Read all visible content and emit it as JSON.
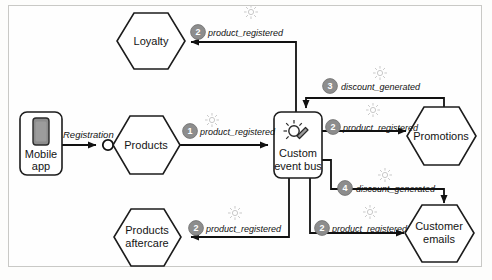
{
  "diagram": {
    "type": "event-driven architecture diagram",
    "frame": {
      "border_color": "#c9c9c6",
      "background": "#fefefe"
    },
    "colors": {
      "stroke": "#1c1c1c",
      "node_fill": "#ffffff",
      "badge_fill": "#8d8d8d",
      "badge_text": "#ffffff",
      "sparkle": "#c9c9c9",
      "connector": "#111111"
    }
  },
  "nodes": [
    {
      "id": "mobile-app",
      "label_line1": "Mobile",
      "label_line2": "app",
      "shape": "rounded-rect",
      "icon": "mobile-phone-icon"
    },
    {
      "id": "products",
      "label_line1": "Products",
      "label_line2": "",
      "shape": "hexagon",
      "icon": ""
    },
    {
      "id": "loyalty",
      "label_line1": "Loyalty",
      "label_line2": "",
      "shape": "hexagon",
      "icon": ""
    },
    {
      "id": "products-aftercare",
      "label_line1": "Products",
      "label_line2": "aftercare",
      "shape": "hexagon",
      "icon": ""
    },
    {
      "id": "custom-event-bus",
      "label_line1": "Custom",
      "label_line2": "event bus",
      "shape": "rounded-rect",
      "icon": "magic-wand-sparkle-icon"
    },
    {
      "id": "promotions",
      "label_line1": "Promotions",
      "label_line2": "",
      "shape": "hexagon",
      "icon": ""
    },
    {
      "id": "customer-emails",
      "label_line1": "Customer",
      "label_line2": "emails",
      "shape": "hexagon",
      "icon": ""
    }
  ],
  "edges": [
    {
      "id": "registration",
      "from": "mobile-app",
      "to": "products",
      "badge": "",
      "label": "Registration",
      "has_sparkle": false,
      "has_port_circle": true
    },
    {
      "id": "products-to-bus",
      "from": "products",
      "to": "custom-event-bus",
      "badge": "1",
      "label": "product_registered",
      "has_sparkle": true,
      "has_port_circle": false
    },
    {
      "id": "bus-to-loyalty",
      "from": "custom-event-bus",
      "to": "loyalty",
      "badge": "2",
      "label": "product_registered",
      "has_sparkle": true,
      "has_port_circle": false
    },
    {
      "id": "bus-to-aftercare",
      "from": "custom-event-bus",
      "to": "products-aftercare",
      "badge": "2",
      "label": "product_registered",
      "has_sparkle": true,
      "has_port_circle": false
    },
    {
      "id": "bus-to-promotions",
      "from": "custom-event-bus",
      "to": "promotions",
      "badge": "2",
      "label": "product_registered",
      "has_sparkle": true,
      "has_port_circle": false
    },
    {
      "id": "bus-to-emails",
      "from": "custom-event-bus",
      "to": "customer-emails",
      "badge": "2",
      "label": "product_registered",
      "has_sparkle": true,
      "has_port_circle": false
    },
    {
      "id": "promotions-to-bus",
      "from": "promotions",
      "to": "custom-event-bus",
      "badge": "3",
      "label": "discount_generated",
      "has_sparkle": true,
      "has_port_circle": false
    },
    {
      "id": "bus-to-emails-disc",
      "from": "custom-event-bus",
      "to": "customer-emails",
      "badge": "4",
      "label": "discount_generated",
      "has_sparkle": true,
      "has_port_circle": false
    }
  ],
  "text": {
    "loyalty": "Loyalty",
    "products": "Products",
    "products_aftercare_l1": "Products",
    "products_aftercare_l2": "aftercare",
    "mobile_app_l1": "Mobile",
    "mobile_app_l2": "app",
    "bus_l1": "Custom",
    "bus_l2": "event bus",
    "promotions": "Promotions",
    "customer_emails_l1": "Customer",
    "customer_emails_l2": "emails",
    "registration": "Registration",
    "product_registered": "product_registered",
    "discount_generated": "discount_generated",
    "b1": "1",
    "b2": "2",
    "b3": "3",
    "b4": "4"
  }
}
